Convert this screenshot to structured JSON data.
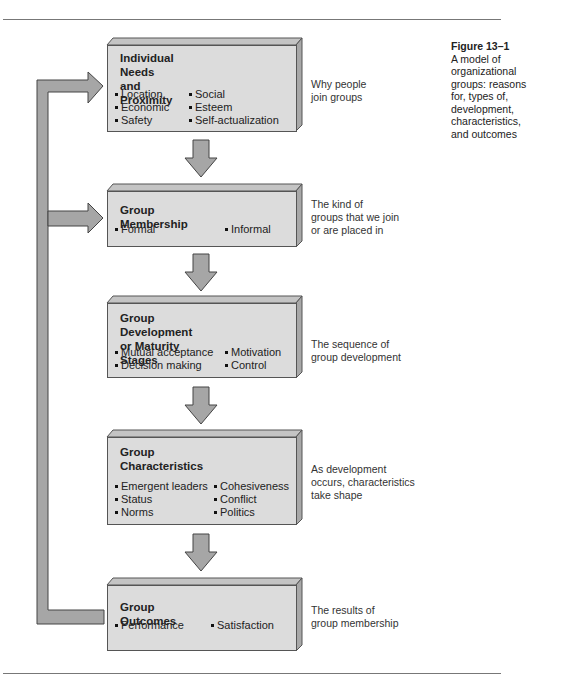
{
  "caption": {
    "figure_label": "Figure 13–1",
    "text_lines": [
      "A model of",
      "organizational",
      "groups: reasons",
      "for, types of,",
      "development,",
      "characteristics,",
      "and outcomes"
    ]
  },
  "boxes": [
    {
      "title_lines": [
        "Individual Needs",
        "and Proximity"
      ],
      "items": [
        "Location",
        "Economic",
        "Safety",
        "Social",
        "Esteem",
        "Self-actualization"
      ],
      "note_lines": [
        "Why people",
        "join groups"
      ]
    },
    {
      "title_lines": [
        "Group Membership"
      ],
      "items": [
        "Formal",
        "Informal"
      ],
      "note_lines": [
        "The kind of",
        "groups that we join",
        "or are placed in"
      ]
    },
    {
      "title_lines": [
        "Group Development",
        "or Maturity Stages"
      ],
      "items": [
        "Mutual acceptance",
        "Decision making",
        "Motivation",
        "Control"
      ],
      "note_lines": [
        "The sequence of",
        "group development"
      ]
    },
    {
      "title_lines": [
        "Group",
        "Characteristics"
      ],
      "items": [
        "Emergent leaders",
        "Status",
        "Norms",
        "Cohesiveness",
        "Conflict",
        "Politics"
      ],
      "note_lines": [
        "As development",
        "occurs, characteristics",
        "take shape"
      ]
    },
    {
      "title_lines": [
        "Group Outcomes"
      ],
      "items": [
        "Performance",
        "Satisfaction"
      ],
      "note_lines": [
        "The results of",
        "group membership"
      ]
    }
  ],
  "colors": {
    "box_face": "#dcdcdc",
    "box_top": "#c4c4c4",
    "box_side": "#a8a8a8",
    "arrow_fill": "#a6a6a6",
    "outline": "#555555"
  }
}
